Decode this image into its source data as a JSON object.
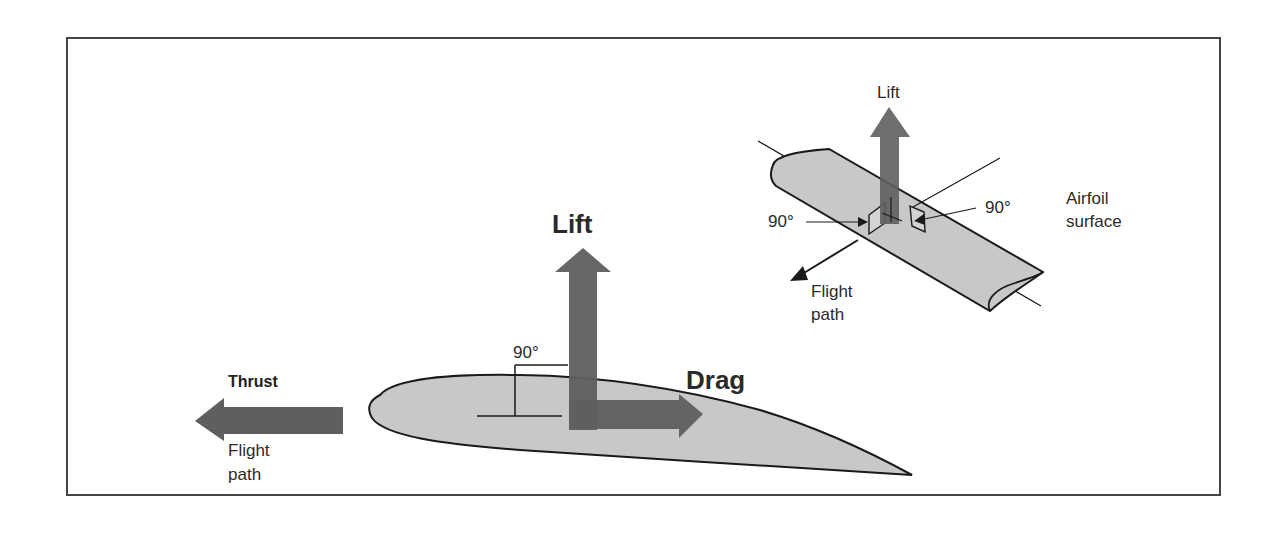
{
  "figure": {
    "main_airfoil": {
      "lift_label": "Lift",
      "drag_label": "Drag",
      "thrust_label": "Thrust",
      "flight_path_label_line1": "Flight",
      "flight_path_label_line2": "path",
      "angle_label": "90°"
    },
    "wing_inset": {
      "lift_label": "Lift",
      "angle_label_left": "90°",
      "angle_label_right": "90°",
      "airfoil_surface_line1": "Airfoil",
      "airfoil_surface_line2": "surface",
      "flight_path_label_line1": "Flight",
      "flight_path_label_line2": "path"
    },
    "colors": {
      "arrow_fill": "#5f5f5f",
      "airfoil_fill": "#c8c8c8",
      "outline": "#1a1a1a",
      "frame": "#444444",
      "background": "#ffffff"
    }
  }
}
